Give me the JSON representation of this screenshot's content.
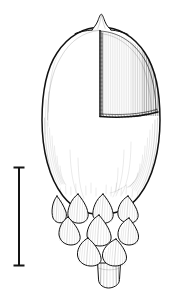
{
  "figure": {
    "kind": "botanical-line-drawing",
    "technique": "pen-and-ink hatching",
    "background_color": "#ffffff",
    "ink_color": "#111111",
    "canvas": {
      "width": 177,
      "height": 293
    },
    "caption": "",
    "labels": []
  },
  "scale_bar": {
    "name": "scale-bar",
    "orientation": "vertical",
    "label": "",
    "x": 19,
    "y_top": 167,
    "y_bottom": 266,
    "length_px": 99,
    "cap_half_width": 5,
    "stem_width": 2.0,
    "cap_thickness": 2.0,
    "color": "#141414"
  },
  "specimen": {
    "name": "acorn-specimen",
    "parts": [
      {
        "name": "apex-style-remnant",
        "label": "apex tip"
      },
      {
        "name": "nut-body",
        "label": "nut"
      },
      {
        "name": "cutaway-window",
        "label": "cut-away hatched panel"
      },
      {
        "name": "cupule-scales",
        "label": "imbricate cupule scales"
      },
      {
        "name": "peduncle",
        "label": "stalk"
      }
    ],
    "body": {
      "center_x": 101,
      "top_y": 27,
      "bottom_y": 215,
      "half_width": 59
    },
    "apex": {
      "x": 101,
      "y": 14,
      "width": 16,
      "height": 14
    },
    "cutaway": {
      "vertical_cut_x": 100,
      "vertical_cut_top_y": 30,
      "vertical_cut_bottom_y": 116,
      "horizontal_cut_y": 116,
      "horizontal_cut_right_x": 160,
      "hatch_lines": 46
    },
    "cupule": {
      "top_y": 196,
      "bottom_y": 268,
      "rows": 3,
      "scales_per_row": [
        4,
        3,
        2
      ],
      "total_scales": 9
    },
    "peduncle": {
      "left_x": 97,
      "right_x": 121,
      "top_y": 262,
      "bottom_y": 287,
      "hatch_lines": 7
    }
  }
}
